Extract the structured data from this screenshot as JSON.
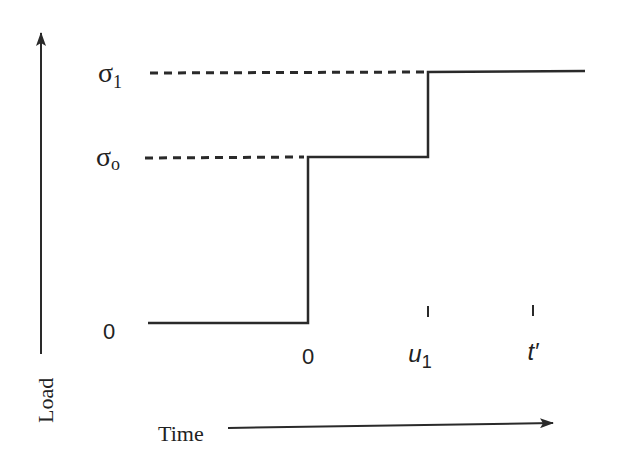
{
  "diagram": {
    "type": "step-load-history",
    "axes": {
      "y_label": "Load",
      "x_label": "Time"
    },
    "y_levels": [
      {
        "id": "sigma1",
        "symbol": "σ",
        "subscript": "1",
        "y": 72
      },
      {
        "id": "sigma0",
        "symbol": "σ",
        "subscript": "o",
        "y": 157
      },
      {
        "id": "zero",
        "label": "0",
        "y": 323
      }
    ],
    "x_marks": [
      {
        "id": "t0",
        "label": "0",
        "x": 308,
        "tick": false
      },
      {
        "id": "u1",
        "label": "u",
        "subscript": "1",
        "x": 428,
        "tick": true
      },
      {
        "id": "tprime",
        "label": "t′",
        "x": 533,
        "tick": true
      }
    ],
    "load_path": [
      [
        148,
        323
      ],
      [
        308,
        323
      ],
      [
        308,
        157
      ],
      [
        428,
        157
      ],
      [
        428,
        72
      ],
      [
        585,
        72
      ]
    ],
    "colors": {
      "line": "#2a2a2a",
      "text": "#222222",
      "background": "#ffffff"
    }
  }
}
